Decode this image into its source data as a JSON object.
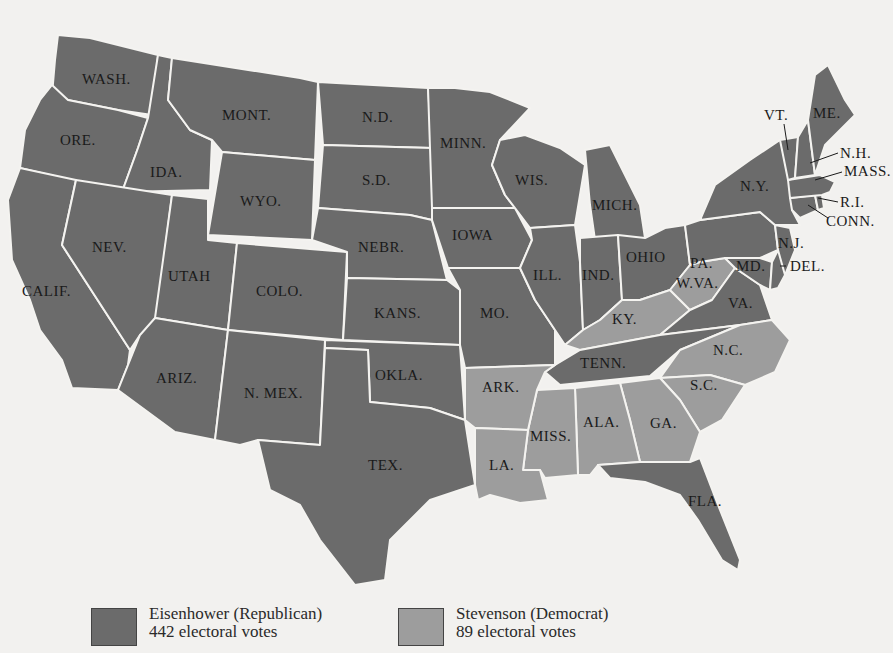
{
  "map": {
    "subject": "United States presidential election map",
    "party_colors": {
      "republican": "#6b6b6b",
      "democrat": "#9d9d9d"
    },
    "states": [
      {
        "label": "WASH.",
        "party": "republican"
      },
      {
        "label": "ORE.",
        "party": "republican"
      },
      {
        "label": "CALIF.",
        "party": "republican"
      },
      {
        "label": "IDA.",
        "party": "republican"
      },
      {
        "label": "NEV.",
        "party": "republican"
      },
      {
        "label": "MONT.",
        "party": "republican"
      },
      {
        "label": "WYO.",
        "party": "republican"
      },
      {
        "label": "UTAH",
        "party": "republican"
      },
      {
        "label": "COLO.",
        "party": "republican"
      },
      {
        "label": "ARIZ.",
        "party": "republican"
      },
      {
        "label": "N. MEX.",
        "party": "republican"
      },
      {
        "label": "N.D.",
        "party": "republican"
      },
      {
        "label": "S.D.",
        "party": "republican"
      },
      {
        "label": "NEBR.",
        "party": "republican"
      },
      {
        "label": "KANS.",
        "party": "republican"
      },
      {
        "label": "OKLA.",
        "party": "republican"
      },
      {
        "label": "TEX.",
        "party": "republican"
      },
      {
        "label": "MINN.",
        "party": "republican"
      },
      {
        "label": "IOWA",
        "party": "republican"
      },
      {
        "label": "MO.",
        "party": "republican"
      },
      {
        "label": "WIS.",
        "party": "republican"
      },
      {
        "label": "ILL.",
        "party": "republican"
      },
      {
        "label": "MICH.",
        "party": "republican"
      },
      {
        "label": "IND.",
        "party": "republican"
      },
      {
        "label": "OHIO",
        "party": "republican"
      },
      {
        "label": "TENN.",
        "party": "republican"
      },
      {
        "label": "VA.",
        "party": "republican"
      },
      {
        "label": "FLA.",
        "party": "republican"
      },
      {
        "label": "PA.",
        "party": "republican"
      },
      {
        "label": "N.Y.",
        "party": "republican"
      },
      {
        "label": "N.J.",
        "party": "republican"
      },
      {
        "label": "MD.",
        "party": "republican"
      },
      {
        "label": "DEL.",
        "party": "republican"
      },
      {
        "label": "CONN.",
        "party": "republican"
      },
      {
        "label": "R.I.",
        "party": "republican"
      },
      {
        "label": "MASS.",
        "party": "republican"
      },
      {
        "label": "VT.",
        "party": "republican"
      },
      {
        "label": "N.H.",
        "party": "republican"
      },
      {
        "label": "ME.",
        "party": "republican"
      },
      {
        "label": "ARK.",
        "party": "democrat"
      },
      {
        "label": "LA.",
        "party": "democrat"
      },
      {
        "label": "MISS.",
        "party": "democrat"
      },
      {
        "label": "ALA.",
        "party": "democrat"
      },
      {
        "label": "GA.",
        "party": "democrat"
      },
      {
        "label": "S.C.",
        "party": "democrat"
      },
      {
        "label": "N.C.",
        "party": "democrat"
      },
      {
        "label": "KY.",
        "party": "democrat"
      },
      {
        "label": "W.VA.",
        "party": "democrat"
      }
    ]
  },
  "legend": {
    "items": [
      {
        "name": "Eisenhower (Republican)",
        "votes": "442 electoral votes",
        "color": "#6b6b6b"
      },
      {
        "name": "Stevenson (Democrat)",
        "votes": "89 electoral votes",
        "color": "#9d9d9d"
      }
    ]
  }
}
